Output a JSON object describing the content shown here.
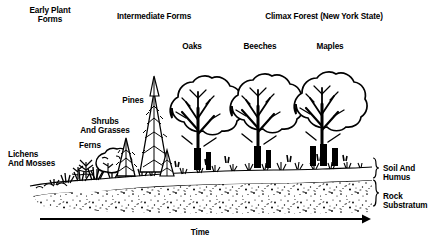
{
  "figure": {
    "ink_color": "#000000",
    "background_color": "#ffffff"
  },
  "stage_headings": [
    {
      "id": "early",
      "text": "Early Plant\nForms",
      "x": 50,
      "y": 6
    },
    {
      "id": "intermediate",
      "text": "Intermediate Forms",
      "x": 154,
      "y": 12
    },
    {
      "id": "climax",
      "text": "Climax Forest (New York State)",
      "x": 324,
      "y": 12
    }
  ],
  "plant_labels": [
    {
      "id": "oaks",
      "text": "Oaks",
      "x": 192,
      "y": 42
    },
    {
      "id": "beeches",
      "text": "Beeches",
      "x": 260,
      "y": 42
    },
    {
      "id": "maples",
      "text": "Maples",
      "x": 330,
      "y": 42
    },
    {
      "id": "pines",
      "text": "Pines",
      "x": 133,
      "y": 96
    },
    {
      "id": "shrubs-and-grasses",
      "text": "Shrubs\nAnd Grasses",
      "x": 105,
      "y": 117
    },
    {
      "id": "ferns",
      "text": "Ferns",
      "x": 90,
      "y": 141
    },
    {
      "id": "lichens-and-mosses",
      "text": "Lichens\nAnd Mosses",
      "x": 8,
      "y": 150
    }
  ],
  "strata_labels": [
    {
      "id": "soil-and-humus",
      "text": "Soil And\nHumus",
      "x": 383,
      "y": 164
    },
    {
      "id": "rock-substratum",
      "text": "Rock\nSubstratum",
      "x": 383,
      "y": 192
    }
  ],
  "axis": {
    "id": "time-axis",
    "label": "Time",
    "label_x": 200,
    "label_y": 228,
    "direction": "left-to-right",
    "arrow_start_x": 40,
    "arrow_end_x": 368,
    "arrow_y": 219
  },
  "succession_sequence": [
    "Lichens And Mosses",
    "Ferns",
    "Shrubs And Grasses",
    "Pines",
    "Oaks",
    "Beeches",
    "Maples"
  ],
  "layers": {
    "vegetation": "Plants increase in size and complexity from left to right",
    "soil_and_humus": "Thin white band beneath vegetation, thickens to the right",
    "rock_substratum": "Stippled bedrock layer at the base of the profile"
  }
}
